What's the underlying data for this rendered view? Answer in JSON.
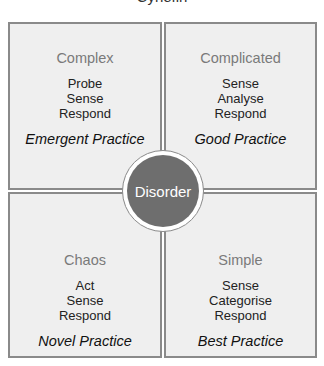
{
  "title_fragment": "Cynefin",
  "center": {
    "label": "Disorder",
    "color": "#6e6e6e"
  },
  "quadrants": [
    {
      "name": "Complex",
      "steps": [
        "Probe",
        "Sense",
        "Respond"
      ],
      "practice": "Emergent Practice"
    },
    {
      "name": "Complicated",
      "steps": [
        "Sense",
        "Analyse",
        "Respond"
      ],
      "practice": "Good Practice"
    },
    {
      "name": "Chaos",
      "steps": [
        "Act",
        "Sense",
        "Respond"
      ],
      "practice": "Novel Practice"
    },
    {
      "name": "Simple",
      "steps": [
        "Sense",
        "Categorise",
        "Respond"
      ],
      "practice": "Best Practice"
    }
  ],
  "colors": {
    "box_fill": "#efefef",
    "box_border": "#8a8a8a",
    "name_text": "#7a7a7a"
  }
}
